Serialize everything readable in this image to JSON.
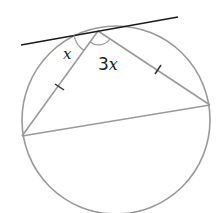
{
  "diagram": {
    "type": "circle-geometry",
    "labels": {
      "angle_tangent_chord": "x",
      "angle_apex_coef": "3",
      "angle_apex_var": "x"
    },
    "elements": {
      "circle": {
        "cx": 116,
        "cy": 120,
        "r": 94
      },
      "tangent_line": {
        "x1": 21,
        "y1": 45,
        "x2": 178,
        "y2": 17
      },
      "tangent_point": {
        "x": 98,
        "y": 31
      },
      "vertex_left": {
        "x": 22,
        "y": 136
      },
      "vertex_right": {
        "x": 210,
        "y": 105
      },
      "equal_side_marks": 2
    },
    "colors": {
      "circle": "#9a9a9a",
      "tangent": "#1a1a1a",
      "text": "#222222"
    }
  }
}
